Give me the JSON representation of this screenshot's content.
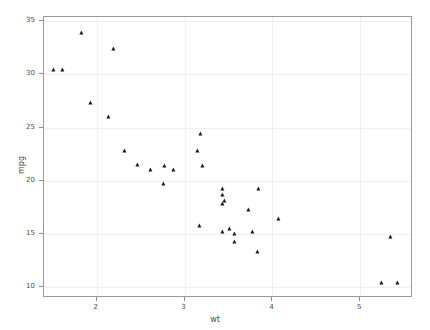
{
  "chart_data": {
    "type": "scatter",
    "title": "",
    "xlabel": "wt",
    "ylabel": "mpg",
    "xlim": [
      1.4,
      5.6
    ],
    "ylim": [
      9.0,
      35.4
    ],
    "xticks": [
      2,
      3,
      4,
      5
    ],
    "xticklabels": [
      "2",
      "3",
      "4",
      "5"
    ],
    "yticks": [
      10,
      15,
      20,
      25,
      30,
      35
    ],
    "yticklabels": [
      "10",
      "15",
      "20",
      "25",
      "30",
      "35"
    ],
    "grid": true,
    "legend": false,
    "marker": "triangle-up",
    "marker_color": "#1a1a1a",
    "marker_size": 5,
    "series": [
      {
        "name": "mtcars",
        "x": [
          2.62,
          2.875,
          2.32,
          3.215,
          3.44,
          3.46,
          3.57,
          3.19,
          3.15,
          3.44,
          3.44,
          4.07,
          3.73,
          3.78,
          5.25,
          5.424,
          5.345,
          2.2,
          1.615,
          1.835,
          2.465,
          3.52,
          3.435,
          3.84,
          3.845,
          1.935,
          2.14,
          1.513,
          3.17,
          2.77,
          3.57,
          2.78
        ],
        "y": [
          21.0,
          21.0,
          22.8,
          21.4,
          18.7,
          18.1,
          14.3,
          24.4,
          22.8,
          19.2,
          17.8,
          16.4,
          17.3,
          15.2,
          10.4,
          10.4,
          14.7,
          32.4,
          30.4,
          33.9,
          21.5,
          15.5,
          15.2,
          13.3,
          19.2,
          27.3,
          26.0,
          30.4,
          15.8,
          19.7,
          15.0,
          21.4
        ]
      }
    ]
  },
  "axes": {
    "x_title": "wt",
    "y_title": "mpg"
  }
}
